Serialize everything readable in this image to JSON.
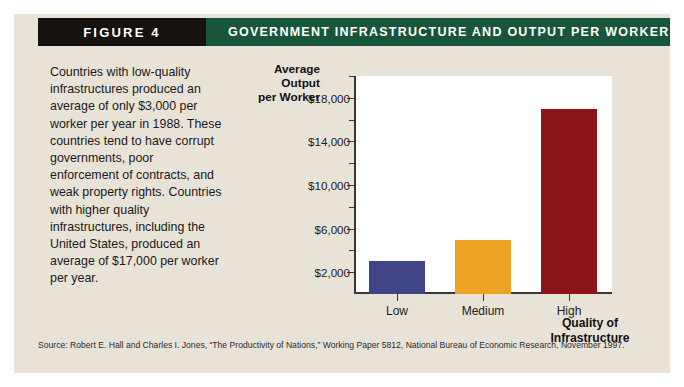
{
  "figure": {
    "tag_label": "FIGURE 4",
    "title": "Government Infrastructure and Output per Worker",
    "description": "Countries with low-quality infrastructures produced an average of only $3,000 per worker per year in 1988. These countries tend to have corrupt governments, poor enforcement of contracts, and weak property rights. Countries with higher quality infrastructures, including the United States, produced an average of $17,000 per worker per year.",
    "source": "Source: Robert E. Hall and Charles I. Jones, “The Productivity of Nations,” Working Paper 5812, National Bureau of Economic Research, November 1997."
  },
  "colors": {
    "panel_background": "#e9e3d7",
    "header_tag_background": "#15120f",
    "header_title_background": "#17563a",
    "axis": "#3b3730",
    "plot_background": "#ffffff",
    "bar_low": "#3f4487",
    "bar_medium": "#efa325",
    "bar_high": "#8a1419"
  },
  "chart_data": {
    "type": "bar",
    "title": "Government Infrastructure and Output per Worker",
    "xlabel": "Quality of Infrastructure",
    "ylabel": "Average Output per Worker",
    "ylabel_lines": [
      "Average",
      "Output",
      "per Worker"
    ],
    "categories": [
      "Low",
      "Medium",
      "High"
    ],
    "values": [
      3000,
      5000,
      17000
    ],
    "bar_colors": [
      "#3f4487",
      "#efa325",
      "#8a1419"
    ],
    "ylim": [
      0,
      20000
    ],
    "ytick_values": [
      2000,
      6000,
      10000,
      14000,
      18000
    ],
    "ytick_labels": [
      "$2,000",
      "$6,000",
      "$10,000",
      "$14,000",
      "$18,000"
    ],
    "yminor_tick_values": [
      4000,
      8000,
      12000,
      16000,
      20000
    ],
    "grid": false,
    "legend": false
  }
}
